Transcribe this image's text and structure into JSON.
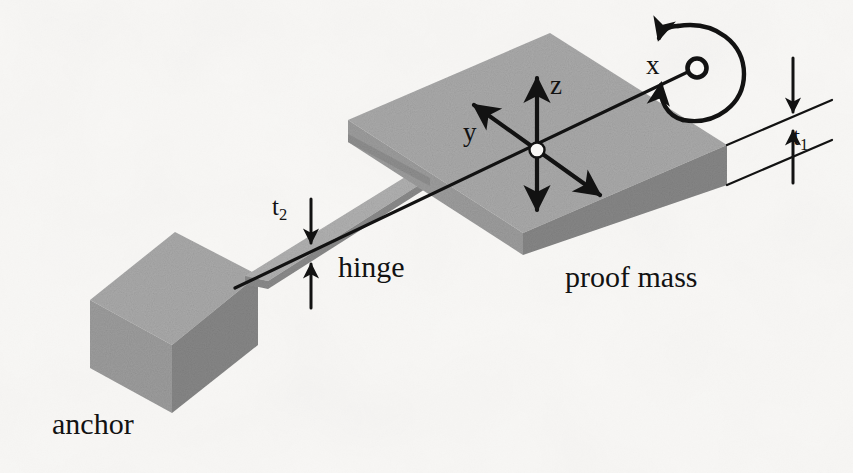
{
  "figure": {
    "domain": "Diagram",
    "kind": "isometric-mechanical-schematic",
    "background_color": "#f8f7f5",
    "ink_color": "#121212",
    "width": 853,
    "height": 473
  },
  "labels": {
    "anchor": "anchor",
    "hinge": "hinge",
    "proof_mass": "proof mass",
    "axis_x": "x",
    "axis_y": "y",
    "axis_z": "z",
    "thickness_proof_mass": "t",
    "thickness_proof_mass_sub": "1",
    "thickness_hinge": "t",
    "thickness_hinge_sub": "2"
  },
  "parts": [
    {
      "name": "anchor",
      "label": "anchor",
      "shape": "rectangular block",
      "faces": {
        "top": "#a9a9a9",
        "left": "#9c9c9c",
        "right": "#868686"
      }
    },
    {
      "name": "hinge",
      "label": "hinge",
      "shape": "thin torsion beam",
      "dimension_label": "t2",
      "faces": {
        "top": "#b0b0b0",
        "side": "#8a8a8a"
      }
    },
    {
      "name": "proof-mass",
      "label": "proof mass",
      "shape": "rectangular slab",
      "dimension_label": "t1",
      "faces": {
        "top": "#a9a9a9",
        "left": "#9c9c9c",
        "right": "#868686"
      }
    }
  ],
  "axes": {
    "origin_marker": "white dot at centre of proof mass",
    "directions": [
      {
        "name": "x",
        "description": "along the hinge axis, toward upper right"
      },
      {
        "name": "y",
        "description": "toward upper left, double headed"
      },
      {
        "name": "z",
        "description": "vertical, double headed"
      }
    ]
  },
  "annotations": {
    "rotation": {
      "name": "rotation-about-x",
      "description": "curved arrow encircling the x axis indicating torsional rotation"
    },
    "dimension_t1": {
      "name": "t1",
      "description": "proof mass thickness, extension lines with opposed arrows at right"
    },
    "dimension_t2": {
      "name": "t2",
      "description": "hinge thickness, opposed arrows above and below the thin beam"
    }
  },
  "colors": {
    "face_top": "#a9a9a9",
    "face_left": "#9c9c9c",
    "face_right": "#868686",
    "hinge_top": "#b0b0b0",
    "hinge_side": "#8a8a8a",
    "ink": "#121212",
    "paper": "#f8f7f5"
  }
}
